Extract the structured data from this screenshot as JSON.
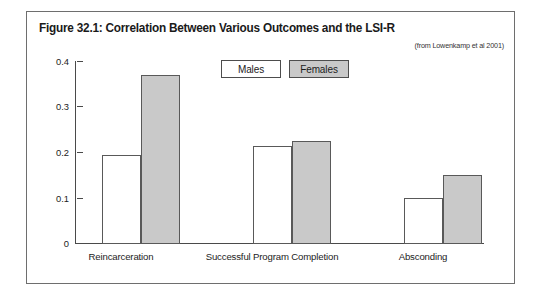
{
  "figure": {
    "title": "Figure 32.1: Correlation Between Various Outcomes and the LSI-R",
    "source": "(from Lowenkamp et al 2001)"
  },
  "legend": {
    "items": [
      {
        "label": "Males",
        "color": "#ffffff"
      },
      {
        "label": "Females",
        "color": "#c9c9c9"
      }
    ]
  },
  "axis": {
    "y_ticks": [
      "0.4",
      "0.3",
      "0.2",
      "0.1",
      "0"
    ]
  },
  "chart_data": {
    "type": "bar",
    "title": "Figure 32.1: Correlation Between Various Outcomes and the LSI-R",
    "subtitle": "(from Lowenkamp et al 2001)",
    "xlabel": "",
    "ylabel": "",
    "ylim": [
      0,
      0.4
    ],
    "ytick_values": [
      0,
      0.1,
      0.2,
      0.3,
      0.4
    ],
    "ytick_labels": [
      "0",
      "0.1",
      "0.2",
      "0.3",
      "0.4"
    ],
    "grid": false,
    "legend_position": "top-center",
    "categories": [
      "Reincarceration",
      "Successful Program Completion",
      "Absconding"
    ],
    "series": [
      {
        "name": "Males",
        "color": "#ffffff",
        "values": [
          0.195,
          0.215,
          0.1
        ]
      },
      {
        "name": "Females",
        "color": "#c9c9c9",
        "values": [
          0.37,
          0.225,
          0.15
        ]
      }
    ]
  }
}
